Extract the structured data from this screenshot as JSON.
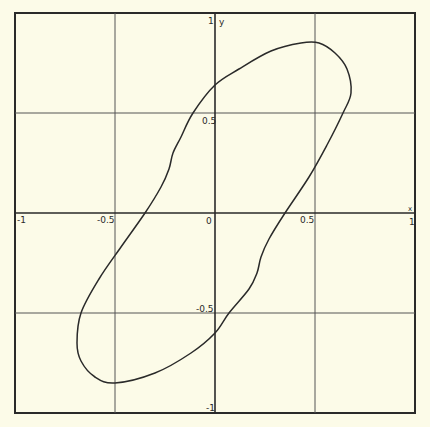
{
  "chart_data": {
    "type": "line",
    "title": "",
    "xlabel": "x",
    "ylabel": "y",
    "xlim": [
      -1,
      1
    ],
    "ylim": [
      -1,
      1
    ],
    "grid": true,
    "gridlines": {
      "x": [
        -0.5,
        0,
        0.5
      ],
      "y": [
        -0.5,
        0,
        0.5
      ]
    },
    "x_tick_labels": [
      "-1",
      "-0.5",
      "0",
      "0.5",
      "1"
    ],
    "y_tick_labels": [
      "1",
      "0.5",
      "-0.5",
      "-1"
    ],
    "legend": null,
    "series": [
      {
        "name": "closed curve",
        "closed": true,
        "points": [
          [
            0.43,
            0.85
          ],
          [
            0.52,
            0.85
          ],
          [
            0.6,
            0.8
          ],
          [
            0.66,
            0.72
          ],
          [
            0.68,
            0.6
          ],
          [
            0.64,
            0.5
          ],
          [
            0.56,
            0.34
          ],
          [
            0.47,
            0.18
          ],
          [
            0.35,
            0.0
          ],
          [
            0.27,
            -0.13
          ],
          [
            0.23,
            -0.22
          ],
          [
            0.21,
            -0.3
          ],
          [
            0.17,
            -0.38
          ],
          [
            0.07,
            -0.5
          ],
          [
            0.0,
            -0.6
          ],
          [
            -0.12,
            -0.7
          ],
          [
            -0.3,
            -0.8
          ],
          [
            -0.5,
            -0.85
          ],
          [
            -0.6,
            -0.82
          ],
          [
            -0.67,
            -0.74
          ],
          [
            -0.69,
            -0.65
          ],
          [
            -0.67,
            -0.5
          ],
          [
            -0.58,
            -0.33
          ],
          [
            -0.47,
            -0.17
          ],
          [
            -0.35,
            0.0
          ],
          [
            -0.27,
            0.13
          ],
          [
            -0.23,
            0.22
          ],
          [
            -0.21,
            0.3
          ],
          [
            -0.17,
            0.38
          ],
          [
            -0.11,
            0.5
          ],
          [
            0.0,
            0.64
          ],
          [
            0.12,
            0.72
          ],
          [
            0.28,
            0.81
          ],
          [
            0.43,
            0.85
          ]
        ]
      }
    ]
  },
  "labels": {
    "x_axis": "x",
    "y_axis": "y",
    "x_minus_1": "-1",
    "x_minus_half": "-0.5",
    "origin": "0",
    "x_half": "0.5",
    "x_plus_1": "1",
    "y_plus_1": "1",
    "y_half": "0.5",
    "y_minus_half": "-0.5",
    "y_minus_1": "-1"
  },
  "colors": {
    "background": "#fcfbe8",
    "ink": "#2a2a2a",
    "grid": "#555555"
  }
}
